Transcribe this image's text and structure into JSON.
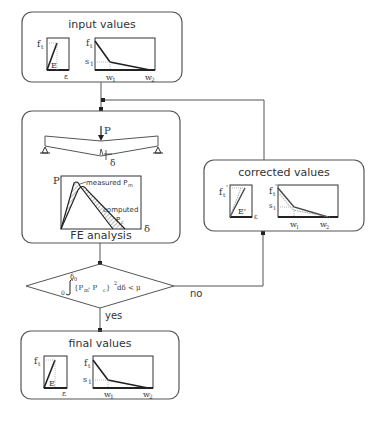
{
  "diagram": {
    "type": "flowchart",
    "colors": {
      "line": "#555555",
      "thick": "#222222",
      "hatch": "#888888"
    },
    "nodes": {
      "input": {
        "title": "input values",
        "left_graph": {
          "y_label": "f",
          "y_sub": "t",
          "x_label": "ε",
          "slope_label": "E"
        },
        "right_graph": {
          "y_label": "f",
          "y_sub": "t",
          "s_label": "s",
          "s_sub": "1",
          "w1_label": "w",
          "w1_sub": "1",
          "w2_label": "w",
          "w2_sub": "2"
        }
      },
      "fe": {
        "title": "FE analysis",
        "beam": {
          "load_label": "P",
          "deflection_label": "δ"
        },
        "graph": {
          "y_label": "P",
          "x_label": "δ",
          "measured_label": "measured P",
          "measured_sub": "m",
          "computed_label": "computed",
          "computed_p": "P",
          "computed_sub": "c"
        }
      },
      "decision": {
        "upper_limit": "δ",
        "upper_sub": "0",
        "lower_limit": "0",
        "integrand": "{P",
        "pm_sub": "m",
        "minus": " - P",
        "pc_sub": "c",
        "tail": " }",
        "exp": "2",
        "rest": " dδ < μ"
      },
      "corrected": {
        "title": "corrected values",
        "left_graph": {
          "y_label": "f",
          "y_sub": "t",
          "prime": "'",
          "x_label": "ε",
          "slope_label": "E'"
        },
        "right_graph": {
          "y_label": "f",
          "y_sub": "t",
          "prime": "'",
          "s_label": "s",
          "s_sub": "1",
          "w1_label": "w",
          "w1_sub": "1",
          "w2_label": "w",
          "w2_sub": "2"
        }
      },
      "final": {
        "title": "final values",
        "left_graph": {
          "y_label": "f",
          "y_sub": "t",
          "x_label": "ε",
          "slope_label": "E"
        },
        "right_graph": {
          "y_label": "f",
          "y_sub": "t",
          "s_label": "s",
          "s_sub": "1",
          "w1_label": "w",
          "w1_sub": "1",
          "w2_label": "w",
          "w2_sub": "2"
        }
      }
    },
    "edges": {
      "yes_label": "yes",
      "no_label": "no"
    }
  }
}
